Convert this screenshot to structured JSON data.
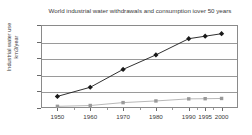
{
  "chart_data": {
    "type": "line",
    "title": "World industrial water withdrawals and consumption iover 50 years",
    "xlabel": "",
    "ylabel": "Industrial water use km3/year",
    "ylabel_line1": "Industrial water use",
    "ylabel_line2": "km3/year",
    "categories": [
      "1950",
      "1960",
      "1970",
      "1980",
      "1990",
      "1995",
      "2000"
    ],
    "x": [
      1950,
      1960,
      1970,
      1980,
      1990,
      1995,
      2000
    ],
    "xlim": [
      1945,
      2005
    ],
    "ylim": [
      0,
      1000
    ],
    "yticks": [
      0,
      200,
      400,
      600,
      800,
      1000
    ],
    "ytick_labels": [
      "0",
      "200",
      "400",
      "600",
      "800",
      "1000"
    ],
    "grid": true,
    "legend": "none",
    "series": [
      {
        "name": "Withdrawals",
        "marker": "diamond",
        "color": "#1a1a1a",
        "values": [
          140,
          250,
          465,
          640,
          835,
          865,
          895
        ]
      },
      {
        "name": "Consumption",
        "marker": "square",
        "color": "#9a9a9a",
        "values": [
          20,
          30,
          65,
          85,
          110,
          112,
          115
        ]
      }
    ]
  },
  "colors": {
    "axis": "#8a8a8a",
    "grid": "#9a9a9a",
    "text": "#3a3a3a",
    "series_primary": "#1a1a1a",
    "series_secondary": "#9a9a9a",
    "background": "#ffffff"
  }
}
